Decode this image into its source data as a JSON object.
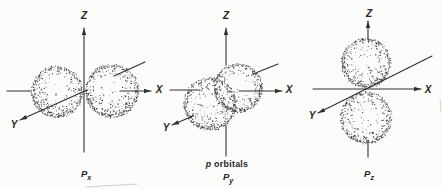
{
  "page": {
    "background": "#fcfcfa",
    "ink": "#2f2f2f",
    "dot_color": "#3a3a3a"
  },
  "figure": {
    "width": 442,
    "height": 189,
    "caption": {
      "prefix": "p",
      "rest": " orbitals",
      "x": 227,
      "y": 167
    },
    "diagrams": [
      {
        "id": "px-orbital-diagram",
        "label": {
          "main": "P",
          "sub": "x",
          "x": 86,
          "y": 177
        },
        "axis_labels": [
          {
            "id": "z",
            "text": "Z",
            "x": 84,
            "y": 19
          },
          {
            "id": "x",
            "text": "X",
            "x": 159,
            "y": 93
          },
          {
            "id": "y",
            "text": "Y",
            "x": 14,
            "y": 128
          }
        ],
        "segments": [
          {
            "axis": "z",
            "x1": 84,
            "y1": 152,
            "x2": 84,
            "y2": 28,
            "arrow": true
          },
          {
            "axis": "x",
            "x1": 7,
            "y1": 91,
            "x2": 31,
            "y2": 91,
            "arrow": false
          },
          {
            "axis": "x",
            "x1": 120,
            "y1": 91,
            "x2": 151,
            "y2": 91,
            "arrow": true
          },
          {
            "axis": "y",
            "x1": 145,
            "y1": 62,
            "x2": 114,
            "y2": 76,
            "arrow": false
          },
          {
            "axis": "y",
            "x1": 87,
            "y1": 90,
            "x2": 20,
            "y2": 120,
            "arrow": true
          }
        ],
        "lobes": [
          {
            "cx": 57,
            "cy": 92,
            "r": 26,
            "seed": 11
          },
          {
            "cx": 112,
            "cy": 91,
            "r": 27,
            "seed": 22
          }
        ]
      },
      {
        "id": "py-orbital-diagram",
        "label": {
          "main": "P",
          "sub": "y",
          "x": 228,
          "y": 180
        },
        "axis_labels": [
          {
            "id": "z",
            "text": "Z",
            "x": 226,
            "y": 19
          },
          {
            "id": "x",
            "text": "X",
            "x": 289,
            "y": 93
          },
          {
            "id": "y",
            "text": "Y",
            "x": 166,
            "y": 131
          }
        ],
        "segments": [
          {
            "axis": "z",
            "x1": 226,
            "y1": 65,
            "x2": 226,
            "y2": 28,
            "arrow": true
          },
          {
            "axis": "z",
            "x1": 226,
            "y1": 125,
            "x2": 226,
            "y2": 156,
            "arrow": false
          },
          {
            "axis": "x",
            "x1": 170,
            "y1": 90,
            "x2": 200,
            "y2": 90,
            "arrow": false
          },
          {
            "axis": "x",
            "x1": 239,
            "y1": 91,
            "x2": 282,
            "y2": 91,
            "arrow": true
          },
          {
            "axis": "y",
            "x1": 278,
            "y1": 64,
            "x2": 253,
            "y2": 74,
            "arrow": false
          },
          {
            "axis": "y",
            "x1": 193,
            "y1": 116,
            "x2": 172,
            "y2": 125,
            "arrow": true
          }
        ],
        "lobes": [
          {
            "cx": 238,
            "cy": 88,
            "r": 24.5,
            "seed": 33
          },
          {
            "cx": 210,
            "cy": 104,
            "r": 26.5,
            "seed": 44
          }
        ]
      },
      {
        "id": "pz-orbital-diagram",
        "label": {
          "main": "P",
          "sub": "z",
          "x": 369,
          "y": 177
        },
        "axis_labels": [
          {
            "id": "z",
            "text": "Z",
            "x": 369,
            "y": 17
          },
          {
            "id": "x",
            "text": "X",
            "x": 428,
            "y": 93
          },
          {
            "id": "y",
            "text": "Y",
            "x": 312,
            "y": 119
          }
        ],
        "segments": [
          {
            "axis": "z",
            "x1": 368,
            "y1": 40,
            "x2": 368,
            "y2": 21,
            "arrow": true
          },
          {
            "axis": "z",
            "x1": 368,
            "y1": 140,
            "x2": 368,
            "y2": 157,
            "arrow": false
          },
          {
            "axis": "x",
            "x1": 313,
            "y1": 89,
            "x2": 421,
            "y2": 89,
            "arrow": true
          },
          {
            "axis": "y",
            "x1": 432,
            "y1": 56,
            "x2": 318,
            "y2": 113,
            "arrow": true
          }
        ],
        "lobes": [
          {
            "cx": 366,
            "cy": 63,
            "r": 25,
            "seed": 55
          },
          {
            "cx": 366,
            "cy": 118,
            "r": 26,
            "seed": 66
          }
        ]
      }
    ],
    "scan_artifacts": [
      {
        "x1": 86,
        "y1": 187,
        "x2": 137,
        "y2": 184,
        "stroke": "#cfcfc8",
        "w": 1
      },
      {
        "x1": 440,
        "y1": 99,
        "x2": 441,
        "y2": 112,
        "stroke": "#d4d4d0",
        "w": 1
      }
    ]
  }
}
